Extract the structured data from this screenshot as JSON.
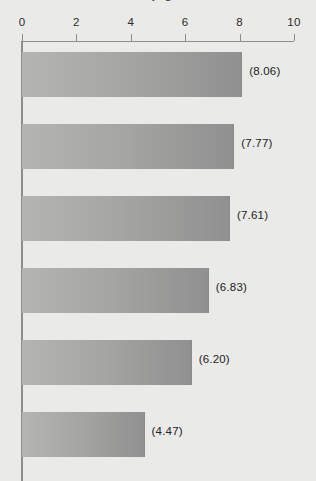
{
  "page": {
    "background_color": "#eaeae8",
    "cropped_title_fragment": "llp  g"
  },
  "chart_data": {
    "type": "bar",
    "orientation": "horizontal",
    "title": "",
    "subtitle": "",
    "xlabel": "",
    "ylabel": "",
    "xlim": [
      0,
      10
    ],
    "ylim": null,
    "grid": false,
    "legend": null,
    "legend_position": "none",
    "axis_position": "top",
    "tick_labels": [
      "0",
      "2",
      "4",
      "6",
      "8",
      "10"
    ],
    "tick_values": [
      0,
      2,
      4,
      6,
      8,
      10
    ],
    "categories": [
      "",
      "",
      "",
      "",
      "",
      ""
    ],
    "values": [
      8.06,
      7.77,
      7.61,
      6.83,
      6.2,
      4.47
    ],
    "data_labels": [
      "(8.06)",
      "(7.77)",
      "(7.61)",
      "(6.83)",
      "(6.20)",
      "(4.47)"
    ],
    "bar_color_start": "#b4b4b2",
    "bar_color_end": "#909090",
    "axis_color": "#8d8d8b",
    "text_color": "#232323"
  }
}
